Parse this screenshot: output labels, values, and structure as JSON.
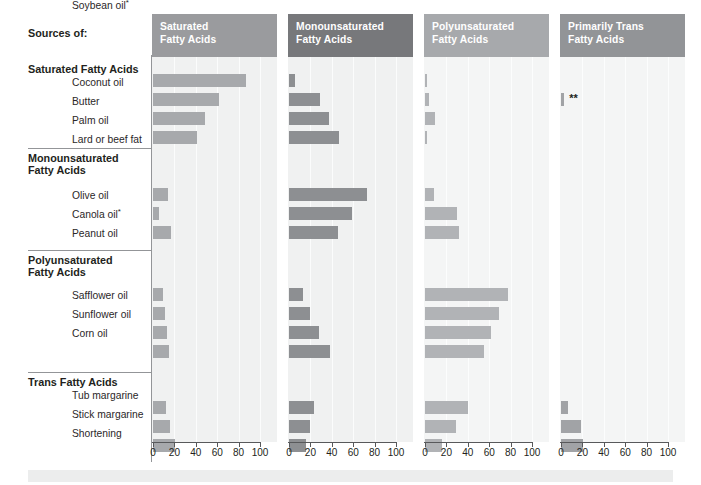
{
  "title_label": "Sources of:",
  "footnote_markers": {
    "single": "*",
    "double": "**"
  },
  "axis": {
    "ticks": [
      0,
      20,
      40,
      60,
      80,
      100
    ],
    "tick_labels": [
      "0",
      "20",
      "40",
      "60",
      "80",
      "100"
    ],
    "min": 0,
    "max": 100
  },
  "colors": {
    "header_saturated": "#9a9b9e",
    "header_monounsaturated": "#77787b",
    "header_polyunsaturated": "#a7a9ac",
    "header_trans": "#929497",
    "bar_saturated": "#a7a9ac",
    "bar_monounsaturated": "#8d8f92",
    "bar_polyunsaturated": "#b1b3b6",
    "bar_trans": "#a1a3a6",
    "plot_background": "#f0f1f1",
    "text": "#231f20",
    "rule": "#939598"
  },
  "groups": [
    {
      "name": "Saturated Fatty Acids",
      "italic_word": "",
      "rows": [
        "Coconut oil",
        "Butter",
        "Palm oil",
        "Lard or beef fat"
      ]
    },
    {
      "name": "Monounsaturated Fatty Acids",
      "italic_word": "",
      "rows": [
        "Olive oil",
        "Canola oil*",
        "Peanut oil"
      ]
    },
    {
      "name": "Polyunsaturated Fatty Acids",
      "italic_word": "",
      "rows": [
        "Safflower oil",
        "Sunflower oil",
        "Corn oil",
        "Soybean oil*"
      ]
    },
    {
      "name": "Trans Fatty Acids",
      "italic_word": "Trans",
      "rows": [
        "Tub margarine",
        "Stick margarine",
        "Shortening"
      ]
    }
  ],
  "columns": [
    {
      "label_line1": "Saturated",
      "label_line2": "Fatty Acids",
      "italic_word": ""
    },
    {
      "label_line1": "Monounsaturated",
      "label_line2": "Fatty Acids",
      "italic_word": ""
    },
    {
      "label_line1": "Polyunsaturated",
      "label_line2": "Fatty Acids",
      "italic_word": ""
    },
    {
      "label_line1": "Primarily Trans",
      "label_line2": "Fatty Acids",
      "italic_word": "Trans"
    }
  ],
  "chart_data": {
    "type": "bar",
    "xlabel": "",
    "ylabel": "",
    "xlim": [
      0,
      100
    ],
    "grid": false,
    "legend": "none",
    "orientation": "horizontal",
    "panels": [
      "Saturated Fatty Acids",
      "Monounsaturated Fatty Acids",
      "Polyunsaturated Fatty Acids",
      "Primarily Trans Fatty Acids"
    ],
    "categories": [
      "Coconut oil",
      "Butter",
      "Palm oil",
      "Lard or beef fat",
      "Olive oil",
      "Canola oil*",
      "Peanut oil",
      "Safflower oil",
      "Sunflower oil",
      "Corn oil",
      "Soybean oil*",
      "Tub margarine",
      "Stick margarine",
      "Shortening"
    ],
    "series": [
      {
        "name": "Saturated Fatty Acids",
        "values": [
          87,
          62,
          49,
          41,
          14,
          6,
          17,
          9,
          11,
          13,
          15,
          12,
          16,
          21
        ]
      },
      {
        "name": "Monounsaturated Fatty Acids",
        "values": [
          6,
          29,
          37,
          47,
          73,
          59,
          46,
          13,
          20,
          28,
          38,
          23,
          20,
          16
        ]
      },
      {
        "name": "Polyunsaturated Fatty Acids",
        "values": [
          2,
          4,
          9,
          2,
          8,
          30,
          32,
          78,
          69,
          62,
          55,
          40,
          29,
          16
        ]
      },
      {
        "name": "Primarily Trans Fatty Acids",
        "values": [
          0,
          3,
          0,
          0,
          0,
          0,
          0,
          0,
          0,
          0,
          0,
          7,
          19,
          21
        ]
      }
    ],
    "annotations": [
      {
        "panel": "Primarily Trans Fatty Acids",
        "category": "Butter",
        "marker": "**"
      }
    ]
  }
}
